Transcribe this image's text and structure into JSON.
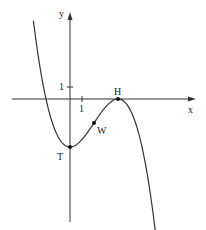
{
  "chart_data": {
    "type": "line",
    "title": "",
    "xlabel": "x",
    "ylabel": "y",
    "function": "f(x) = -x^3/8 + 3x^2/4 - 4",
    "tick_labels": {
      "x": [
        "1"
      ],
      "y": [
        "1"
      ]
    },
    "xlim": [
      -5.5,
      11
    ],
    "ylim": [
      -11.5,
      8
    ],
    "points": [
      {
        "label": "T",
        "x": 0,
        "y": -4,
        "kind": "local minimum"
      },
      {
        "label": "W",
        "x": 2,
        "y": -2,
        "kind": "inflection point"
      },
      {
        "label": "H",
        "x": 4,
        "y": 0,
        "kind": "local maximum"
      }
    ],
    "series": [
      {
        "name": "f",
        "x": [
          -3,
          -2,
          -1,
          0,
          1,
          2,
          3,
          4,
          5,
          6,
          7
        ],
        "values": [
          6.125,
          0,
          -3.125,
          -4,
          -3.375,
          -2,
          -0.875,
          0,
          -0.875,
          -4,
          -10.125
        ]
      }
    ],
    "grid": false,
    "legend": null
  },
  "labels": {
    "x_axis": "x",
    "y_axis": "y",
    "x_tick": "1",
    "y_tick": "1",
    "point_T": "T",
    "point_W": "W",
    "point_H": "H"
  }
}
